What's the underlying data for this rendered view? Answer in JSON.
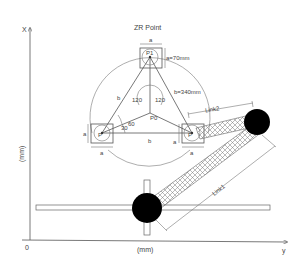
{
  "title": "ZR Point",
  "axes": {
    "vertical_label": "X",
    "vertical_unit": "(mm)",
    "horizontal_label": "y",
    "horizontal_unit": "(mm)",
    "origin_label": "0"
  },
  "points": {
    "p0": "P0",
    "p1": "P1",
    "p2": "P",
    "p3": "P"
  },
  "dimensions": {
    "a_label": "a",
    "a_value": "a=70mm",
    "b_label": "b",
    "b_value": "b=340mm"
  },
  "angles": {
    "angle_120_left": "120",
    "angle_120_right": "120",
    "angle_30": "30",
    "angle_60": "60"
  },
  "links": {
    "link1": "Link1",
    "link2": "Link2"
  },
  "colors": {
    "line": "#555555",
    "ball": "#000000",
    "background": "#ffffff"
  }
}
